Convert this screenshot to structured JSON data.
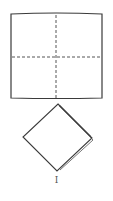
{
  "diagram": {
    "type": "paper-folding",
    "step_label": "I",
    "square": {
      "description": "square sheet with dashed fold lines (vertical and horizontal center creases)",
      "x1": 11,
      "y1": 14,
      "x2": 102,
      "y2": 98,
      "fold_lines": [
        "vertical-center",
        "horizontal-center"
      ]
    },
    "folded_result": {
      "description": "square folded into quarters, rotated 45 degrees (diamond)",
      "top": [
        58,
        104
      ],
      "right": [
        92,
        138
      ],
      "bottom": [
        57,
        171
      ],
      "left": [
        23,
        137
      ]
    },
    "colors": {
      "stroke": "#3a3a3a",
      "dashed": "#555555",
      "background": "#ffffff"
    }
  }
}
